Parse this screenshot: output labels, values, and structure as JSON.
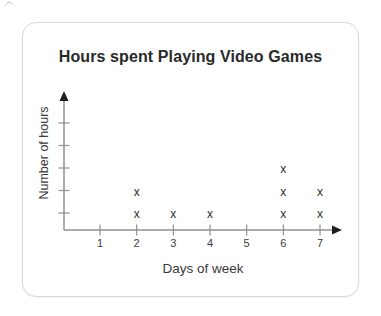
{
  "page": {
    "background": "#ffffff",
    "decorations": {
      "top_left_stray_mark": true
    }
  },
  "card": {
    "background": "#ffffff",
    "border_color": "#d9d9d9"
  },
  "chart_data": {
    "type": "scatter",
    "subtype": "line-plot-stacked-x-marks",
    "title": "Hours spent Playing Video Games",
    "xlabel": "Days of week",
    "ylabel": "Number of hours",
    "categories": [
      "1",
      "2",
      "3",
      "4",
      "5",
      "6",
      "7"
    ],
    "values": [
      0,
      2,
      1,
      1,
      0,
      3,
      2
    ],
    "marker": "x",
    "x_axis": {
      "tick_labels_visible": true,
      "arrow": true
    },
    "y_axis": {
      "tick_count": 5,
      "tick_labels_visible": false,
      "arrow": true
    },
    "grid": false,
    "legend": false,
    "colors": {
      "axis": "#909090",
      "arrowhead": "#1f1f1f",
      "marker": "#2e2e2e",
      "tick_label_text": "#3c3c3c",
      "title_text": "#2a2a2a",
      "axis_label_text": "#3a3a3a"
    }
  }
}
